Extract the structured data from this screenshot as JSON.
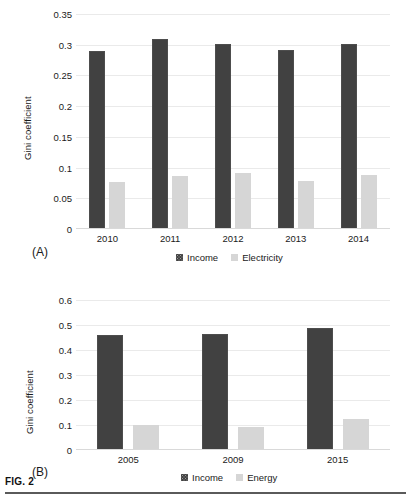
{
  "figure": {
    "caption": "FIG. 2",
    "panel_a_letter": "(A)",
    "panel_b_letter": "(B)"
  },
  "colors": {
    "income_bar": "#414141",
    "secondary_bar": "#d6d6d6",
    "gridline": "#eaeaea",
    "axis": "#d9d9d9",
    "text": "#1a1a1a",
    "rule": "#5a5a5a"
  },
  "chart_data": [
    {
      "type": "bar",
      "panel": "(A)",
      "title": "",
      "xlabel": "",
      "ylabel": "Gini coefficient",
      "categories": [
        "2010",
        "2011",
        "2012",
        "2013",
        "2014"
      ],
      "series": [
        {
          "name": "Income",
          "values": [
            0.29,
            0.31,
            0.301,
            0.292,
            0.302
          ]
        },
        {
          "name": "Electricity",
          "values": [
            0.076,
            0.086,
            0.092,
            0.078,
            0.088
          ]
        }
      ],
      "ylim": [
        0,
        0.35
      ],
      "yticks": [
        "0",
        "0.05",
        "0.1",
        "0.15",
        "0.2",
        "0.25",
        "0.3",
        "0.35"
      ],
      "ytick_values": [
        0,
        0.05,
        0.1,
        0.15,
        0.2,
        0.25,
        0.3,
        0.35
      ],
      "grid": true,
      "legend_position": "bottom"
    },
    {
      "type": "bar",
      "panel": "(B)",
      "title": "",
      "xlabel": "",
      "ylabel": "Gini coefficient",
      "categories": [
        "2005",
        "2009",
        "2015"
      ],
      "series": [
        {
          "name": "Income",
          "values": [
            0.461,
            0.465,
            0.489
          ]
        },
        {
          "name": "Energy",
          "values": [
            0.1,
            0.093,
            0.125
          ]
        }
      ],
      "ylim": [
        0,
        0.6
      ],
      "yticks": [
        "0",
        "0.1",
        "0.2",
        "0.3",
        "0.4",
        "0.5",
        "0.6"
      ],
      "ytick_values": [
        0,
        0.1,
        0.2,
        0.3,
        0.4,
        0.5,
        0.6
      ],
      "grid": true,
      "legend_position": "bottom"
    }
  ]
}
